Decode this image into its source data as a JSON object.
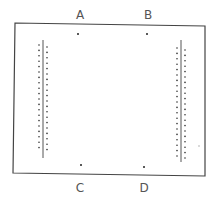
{
  "diagram": {
    "labels": [
      {
        "text": "A",
        "x": 80,
        "y": 19
      },
      {
        "text": "B",
        "x": 148,
        "y": 19
      },
      {
        "text": "C",
        "x": 80,
        "y": 192
      },
      {
        "text": "D",
        "x": 144,
        "y": 192
      }
    ],
    "points": [
      {
        "name": "A",
        "x": 78,
        "y": 34
      },
      {
        "name": "B",
        "x": 147,
        "y": 34
      },
      {
        "name": "C",
        "x": 81,
        "y": 165
      },
      {
        "name": "D",
        "x": 144,
        "y": 167
      }
    ],
    "frame": {
      "color": "#444444"
    },
    "electrodes": [
      {
        "side": "left",
        "line_x": 43,
        "y1": 40,
        "y2": 158,
        "dots_outer_x": 39,
        "dots_inner_x": 47,
        "count": 20,
        "start_y": 45,
        "step": 5.4
      },
      {
        "side": "right",
        "line_x": 181,
        "y1": 40,
        "y2": 162,
        "dots_outer_x": 177,
        "dots_inner_x": 185,
        "count": 21,
        "start_y": 48,
        "step": 5.4
      }
    ],
    "stray_dot": {
      "x": 199,
      "y": 146
    }
  }
}
